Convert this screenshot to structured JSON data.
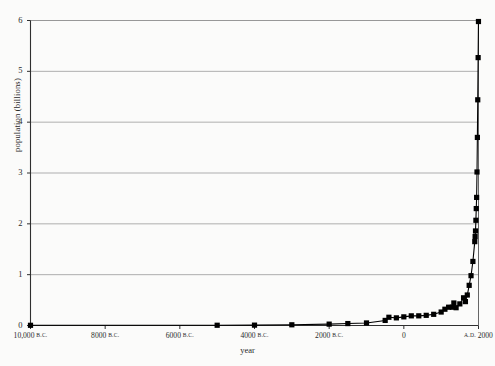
{
  "chart_data": {
    "type": "line",
    "title": "",
    "xlabel": "year",
    "ylabel": "population (billions)",
    "xlim": [
      -10000,
      2000
    ],
    "ylim": [
      0,
      6
    ],
    "grid": true,
    "legend": null,
    "marker": "square",
    "marker_color": "#000000",
    "line_color": "#000000",
    "y_ticks": [
      0,
      1,
      2,
      3,
      4,
      5,
      6
    ],
    "y_tick_labels": [
      "0",
      "1",
      "2",
      "3",
      "4",
      "5",
      "6"
    ],
    "x_ticks": [
      -10000,
      -8000,
      -6000,
      -4000,
      -2000,
      0,
      2000
    ],
    "x_tick_labels": [
      {
        "num": "10,000",
        "era": "B.C."
      },
      {
        "num": "8000",
        "era": "B.C."
      },
      {
        "num": "6000",
        "era": "B.C."
      },
      {
        "num": "4000",
        "era": "B.C."
      },
      {
        "num": "2000",
        "era": "B.C."
      },
      {
        "num": "0",
        "era": ""
      },
      {
        "num": "2000",
        "era": "A.D.",
        "era_before": true
      }
    ],
    "x": [
      -10000,
      -5000,
      -4000,
      -3000,
      -2000,
      -1500,
      -1000,
      -500,
      -400,
      -200,
      0,
      200,
      400,
      600,
      800,
      1000,
      1100,
      1200,
      1300,
      1340,
      1400,
      1500,
      1600,
      1650,
      1700,
      1750,
      1800,
      1850,
      1900,
      1910,
      1920,
      1930,
      1940,
      1950,
      1960,
      1970,
      1980,
      1990,
      1999
    ],
    "values": [
      0.004,
      0.005,
      0.007,
      0.014,
      0.027,
      0.038,
      0.05,
      0.1,
      0.162,
      0.15,
      0.17,
      0.19,
      0.19,
      0.2,
      0.22,
      0.265,
      0.32,
      0.36,
      0.36,
      0.443,
      0.35,
      0.425,
      0.545,
      0.47,
      0.6,
      0.79,
      0.98,
      1.26,
      1.65,
      1.75,
      1.86,
      2.07,
      2.3,
      2.52,
      3.02,
      3.7,
      4.44,
      5.27,
      5.98
    ],
    "series_name": "world population"
  }
}
